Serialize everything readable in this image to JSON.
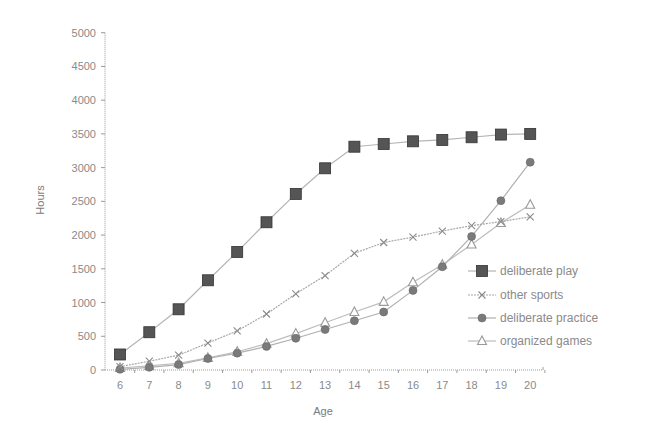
{
  "chart_data": {
    "type": "line",
    "title": "",
    "xlabel": "Age",
    "ylabel": "Hours",
    "x": [
      6,
      7,
      8,
      9,
      10,
      11,
      12,
      13,
      14,
      15,
      16,
      17,
      18,
      19,
      20
    ],
    "ylim": [
      0,
      5000
    ],
    "yticks": [
      0,
      500,
      1000,
      1500,
      2000,
      2500,
      3000,
      3500,
      4000,
      4500,
      5000
    ],
    "grid": false,
    "legend_position": "right-inside-lower",
    "series": [
      {
        "name": "deliberate play",
        "marker": "square",
        "color": "#555555",
        "line_color": "#b5b5b5",
        "values": [
          230,
          560,
          900,
          1330,
          1750,
          2190,
          2610,
          2990,
          3310,
          3350,
          3390,
          3410,
          3450,
          3490,
          3500
        ]
      },
      {
        "name": "other sports",
        "marker": "x",
        "color": "#8a8a8a",
        "line_color": "#a8a8a8",
        "values": [
          50,
          130,
          220,
          400,
          580,
          830,
          1130,
          1400,
          1730,
          1890,
          1970,
          2060,
          2140,
          2200,
          2270
        ]
      },
      {
        "name": "deliberate practice",
        "marker": "circle",
        "color": "#7a7a7a",
        "line_color": "#b0b0b0",
        "values": [
          10,
          40,
          80,
          170,
          250,
          350,
          470,
          600,
          730,
          860,
          1180,
          1530,
          1980,
          2510,
          3080
        ]
      },
      {
        "name": "organized games",
        "marker": "triangle",
        "color": "#9a9a9a",
        "line_color": "#bdbdbd",
        "values": [
          30,
          60,
          100,
          180,
          270,
          390,
          540,
          700,
          860,
          1010,
          1300,
          1560,
          1860,
          2180,
          2450
        ]
      }
    ]
  }
}
